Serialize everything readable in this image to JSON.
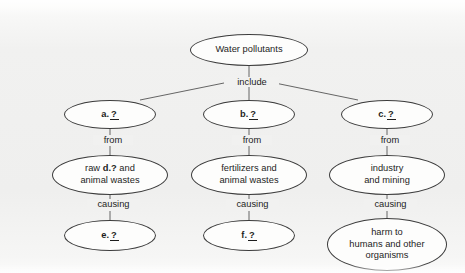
{
  "diagram": {
    "type": "concept-map",
    "title_node": "Water pollutants",
    "background_color": "#f1f1f0",
    "stroke_color": "#3c3c3c",
    "text_color": "#1d1d1d",
    "nodes": [
      {
        "id": "root",
        "text": "Water pollutants",
        "blank": ""
      },
      {
        "id": "a",
        "text": "",
        "blank": "a."
      },
      {
        "id": "b",
        "text": "",
        "blank": "b."
      },
      {
        "id": "c",
        "text": "",
        "blank": "c."
      },
      {
        "id": "d",
        "text_before": "raw ",
        "blank": "d.",
        "text_after": " and\nanimal wastes"
      },
      {
        "id": "src_b",
        "text": "fertilizers and\nanimal wastes",
        "blank": ""
      },
      {
        "id": "src_c",
        "text": "industry\nand mining",
        "blank": ""
      },
      {
        "id": "e",
        "text": "",
        "blank": "e."
      },
      {
        "id": "f",
        "text": "",
        "blank": "f."
      },
      {
        "id": "effect_c",
        "text": "harm to\nhumans and other\norganisms",
        "blank": ""
      }
    ],
    "blank_marker": "?",
    "edge_labels": {
      "include": "include",
      "from_a": "from",
      "from_b": "from",
      "from_c": "from",
      "causing_a": "causing",
      "causing_b": "causing",
      "causing_c": "causing"
    }
  }
}
